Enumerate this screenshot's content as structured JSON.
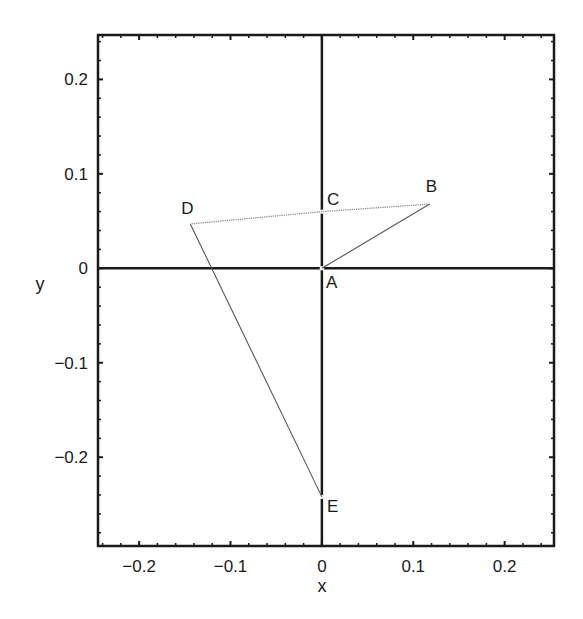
{
  "chart_data": {
    "type": "line",
    "title": "",
    "xlabel": "x",
    "ylabel": "y",
    "xlim": [
      -0.245,
      0.254
    ],
    "ylim": [
      -0.294,
      0.247
    ],
    "grid": false,
    "legend": null,
    "x_ticks": [
      -0.2,
      -0.1,
      0,
      0.1,
      0.2
    ],
    "x_tick_labels": [
      "−0.2",
      "−0.1",
      "0",
      "0.1",
      "0.2"
    ],
    "y_ticks": [
      0.2,
      0.1,
      0,
      -0.1,
      -0.2
    ],
    "y_tick_labels": [
      "0.2",
      "0.1",
      "0",
      "−0.1",
      "−0.2"
    ],
    "reference_lines": [
      {
        "type": "horizontal",
        "value": 0
      },
      {
        "type": "vertical",
        "value": 0
      }
    ],
    "points": [
      {
        "label": "A",
        "x": 0,
        "y": 0
      },
      {
        "label": "B",
        "x": 0.118,
        "y": 0.068
      },
      {
        "label": "C",
        "x": 0,
        "y": 0.06
      },
      {
        "label": "D",
        "x": -0.144,
        "y": 0.047
      },
      {
        "label": "E",
        "x": 0,
        "y": -0.242
      }
    ],
    "series": [
      {
        "name": "A-B",
        "x": [
          0,
          0.118
        ],
        "y": [
          0,
          0.068
        ],
        "style": "solid-thin"
      },
      {
        "name": "B-C-D",
        "x": [
          0.118,
          0,
          -0.144
        ],
        "y": [
          0.068,
          0.06,
          0.047
        ],
        "style": "dotted-thin"
      },
      {
        "name": "D-E",
        "x": [
          -0.144,
          0
        ],
        "y": [
          0.047,
          -0.242
        ],
        "style": "solid-thin"
      }
    ]
  },
  "colors": {
    "axis": "#1a1a1a",
    "line": "#555555",
    "dotted": "#8a8a8a"
  }
}
